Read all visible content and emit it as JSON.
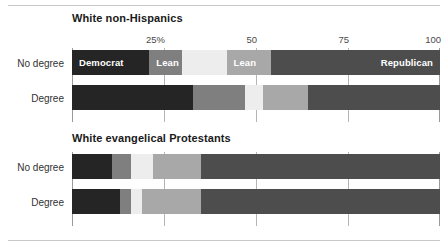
{
  "chart_data": {
    "type": "bar",
    "subtype": "stacked-horizontal-100pct",
    "title": "",
    "xlabel": "",
    "ylabel": "",
    "xlim": [
      0,
      100
    ],
    "grid": true,
    "legend_position": "inline-bar-labels",
    "axis": {
      "ticks": [
        25,
        50,
        75,
        100
      ],
      "tick_labels": [
        "25%",
        "50",
        "75",
        "100"
      ]
    },
    "series": [
      {
        "name": "Democrat",
        "color": "#252525"
      },
      {
        "name": "Lean Dem",
        "color": "#7f7f7f"
      },
      {
        "name": "Independent",
        "color": "#ededed"
      },
      {
        "name": "Lean Rep",
        "color": "#a8a8a8"
      },
      {
        "name": "Republican",
        "color": "#4d4d4d"
      }
    ],
    "panels": [
      {
        "title": "White non-Hispanics",
        "categories": [
          "No degree",
          "Degree"
        ],
        "rows": [
          {
            "category": "No degree",
            "values": [
              21,
              9,
              12,
              12,
              46
            ],
            "labels": [
              "Democrat",
              "Lean",
              "",
              "Lean",
              "Republican"
            ]
          },
          {
            "category": "Degree",
            "values": [
              33,
              14,
              5,
              12,
              36
            ],
            "labels": [
              "",
              "",
              "",
              "",
              ""
            ]
          }
        ]
      },
      {
        "title": "White evangelical Protestants",
        "categories": [
          "No degree",
          "Degree"
        ],
        "rows": [
          {
            "category": "No degree",
            "values": [
              11,
              5,
              6,
              13,
              65
            ],
            "labels": [
              "",
              "",
              "",
              "",
              ""
            ]
          },
          {
            "category": "Degree",
            "values": [
              13,
              3,
              3,
              16,
              65
            ],
            "labels": [
              "",
              "",
              "",
              "",
              ""
            ]
          }
        ]
      }
    ]
  }
}
